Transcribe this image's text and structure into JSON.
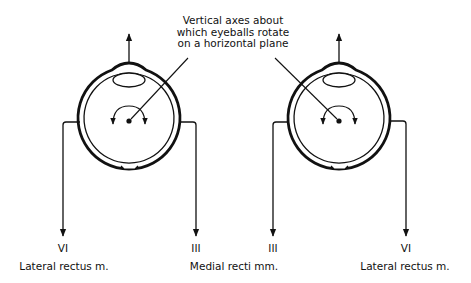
{
  "caption": {
    "lines": [
      "Vertical axes about",
      "which eyeballs rotate",
      "on a horizontal plane"
    ]
  },
  "eyes": [
    {
      "side": "left",
      "nerves": [
        {
          "nerve": "VI",
          "muscle_label": "Lateral rectus m."
        },
        {
          "nerve": "III"
        }
      ]
    },
    {
      "side": "right",
      "nerves": [
        {
          "nerve": "III"
        },
        {
          "nerve": "VI",
          "muscle_label": "Lateral rectus m."
        }
      ]
    }
  ],
  "labels": {
    "left_lateral_nerve": "VI",
    "left_lateral_muscle": "Lateral rectus m.",
    "left_medial_nerve": "III",
    "right_medial_nerve": "III",
    "medial_muscle": "Medial recti mm.",
    "right_lateral_nerve": "VI",
    "right_lateral_muscle": "Lateral rectus m."
  },
  "colors": {
    "stroke": "#111111",
    "background": "#ffffff"
  }
}
